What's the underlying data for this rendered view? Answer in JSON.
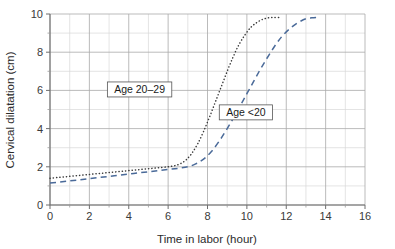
{
  "chart_data": {
    "type": "line",
    "title": "",
    "xlabel": "Time in labor (hour)",
    "ylabel": "Cervical dilatation (cm)",
    "xlim": [
      0,
      16
    ],
    "ylim": [
      0,
      10
    ],
    "xticks": [
      "0",
      "2",
      "4",
      "6",
      "8",
      "10",
      "12",
      "14",
      "16"
    ],
    "yticks": [
      "0",
      "2",
      "4",
      "6",
      "8",
      "10"
    ],
    "xtick_values": [
      0,
      2,
      4,
      6,
      8,
      10,
      12,
      14,
      16
    ],
    "ytick_values": [
      0,
      2,
      4,
      6,
      8,
      10
    ],
    "grid": true,
    "grid_minor_step_x": 1,
    "grid_minor_step_y": 1,
    "legend_position": "inline-annotations",
    "series": [
      {
        "name": "Age 20-29",
        "label": "Age 20–29",
        "style": "dotted",
        "color": "#3a3a3a",
        "label_x": 4.55,
        "label_y": 6.05,
        "x": [
          0,
          0.5,
          1,
          1.5,
          2,
          2.5,
          3,
          3.5,
          4,
          4.5,
          5,
          5.5,
          6,
          6.3,
          6.6,
          6.9,
          7.2,
          7.5,
          7.8,
          8.1,
          8.4,
          8.7,
          9,
          9.3,
          9.6,
          9.9,
          10.2,
          10.5,
          10.8,
          11.1,
          11.4,
          11.7
        ],
        "y": [
          1.4,
          1.45,
          1.5,
          1.55,
          1.6,
          1.65,
          1.7,
          1.75,
          1.8,
          1.85,
          1.9,
          1.95,
          2.0,
          2.05,
          2.15,
          2.35,
          2.7,
          3.2,
          3.85,
          4.6,
          5.4,
          6.2,
          7.0,
          7.75,
          8.4,
          8.9,
          9.3,
          9.55,
          9.72,
          9.8,
          9.82,
          9.82
        ]
      },
      {
        "name": "Age <20",
        "label": "Age <20",
        "style": "dashed",
        "color": "#4a6a99",
        "label_x": 9.95,
        "label_y": 4.85,
        "x": [
          0,
          0.5,
          1,
          1.5,
          2,
          2.5,
          3,
          3.5,
          4,
          4.5,
          5,
          5.5,
          6,
          6.5,
          7,
          7.4,
          7.8,
          8.2,
          8.6,
          9,
          9.4,
          9.8,
          10.2,
          10.6,
          11,
          11.4,
          11.8,
          12.2,
          12.6,
          13,
          13.3,
          13.6
        ],
        "y": [
          1.15,
          1.2,
          1.26,
          1.32,
          1.38,
          1.44,
          1.5,
          1.56,
          1.62,
          1.68,
          1.74,
          1.8,
          1.86,
          1.92,
          2.0,
          2.15,
          2.4,
          2.8,
          3.35,
          4.0,
          4.7,
          5.45,
          6.2,
          6.95,
          7.65,
          8.3,
          8.85,
          9.25,
          9.55,
          9.75,
          9.8,
          9.82
        ]
      }
    ]
  },
  "layout": {
    "plot_left": 50,
    "plot_right": 365,
    "plot_top": 14,
    "plot_bottom": 205
  }
}
